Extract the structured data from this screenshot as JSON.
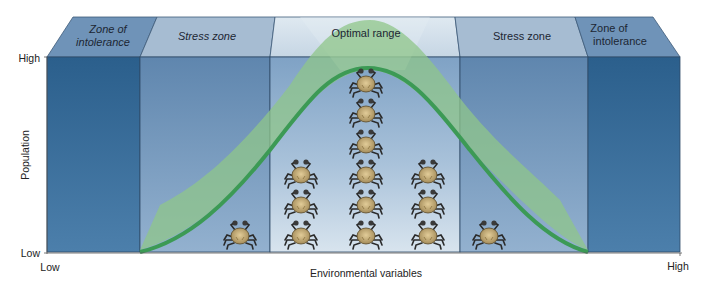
{
  "diagram": {
    "zones": [
      {
        "id": "intolerance-low",
        "label_lines": [
          "Zone of",
          "intolerance"
        ],
        "style": "italic"
      },
      {
        "id": "stress-low",
        "label_lines": [
          "Stress zone"
        ],
        "style": "italic"
      },
      {
        "id": "optimal",
        "label_lines": [
          "Optimal range"
        ],
        "style": "normal"
      },
      {
        "id": "stress-high",
        "label_lines": [
          "Stress zone"
        ],
        "style": "normal"
      },
      {
        "id": "intolerance-high",
        "label_lines": [
          "Zone of",
          "intolerance"
        ],
        "style": "normal"
      }
    ],
    "y_axis": {
      "label": "Population",
      "high": "High",
      "low": "Low"
    },
    "x_axis": {
      "label": "Environmental variables",
      "low": "Low",
      "high": "High"
    },
    "crab_columns": [
      {
        "zone": "stress-low",
        "count": 1
      },
      {
        "zone": "optimal",
        "count": 3
      },
      {
        "zone": "optimal",
        "count": 6
      },
      {
        "zone": "optimal",
        "count": 3
      },
      {
        "zone": "stress-high",
        "count": 1
      }
    ],
    "colors": {
      "intolerance": "#2f6592",
      "stress": "#6f93b8",
      "optimal_top": "#cfe0ec",
      "optimal_bottom": "#9db8d2",
      "curve": "#3f9a58",
      "curve_band": "#8fc68a"
    }
  }
}
